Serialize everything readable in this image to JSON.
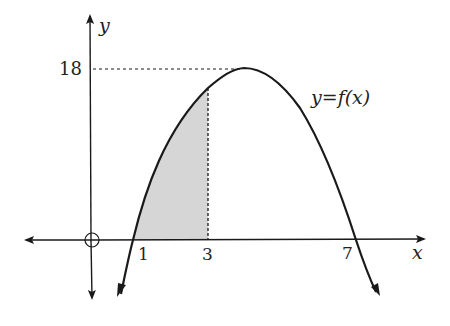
{
  "diagram": {
    "axes": {
      "x_label": "x",
      "y_label": "y",
      "origin_marker": "circle-with-cross"
    },
    "curve": {
      "label": "y = f(x)",
      "label_parts": {
        "lhs": "y",
        "eq": "=",
        "rhs": "f(x)"
      },
      "shape": "downward parabola",
      "roots": [
        1,
        7
      ],
      "vertex_y": 18
    },
    "tick_labels": {
      "x": [
        "1",
        "3",
        "7"
      ],
      "y": [
        "18"
      ]
    },
    "shaded_region": {
      "from_x": 1,
      "to_x": 3,
      "color": "#d6d6d6"
    },
    "guides": {
      "horizontal_dashed_at_y": "18",
      "vertical_dashed_at_x": "3"
    },
    "colors": {
      "line": "#1a1a1a",
      "shade": "#d6d6d6",
      "text": "#222222"
    }
  }
}
